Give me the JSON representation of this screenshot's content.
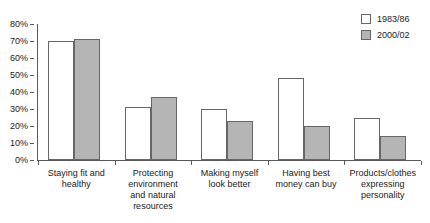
{
  "chart_data": {
    "type": "bar",
    "title": "",
    "xlabel": "",
    "ylabel": "",
    "ylim": [
      0,
      80
    ],
    "grid": false,
    "legend_position": "top-right",
    "ytick_labels": [
      "80%",
      "70%",
      "60%",
      "50%",
      "40%",
      "30%",
      "20%",
      "10%",
      "0%"
    ],
    "ytick_values": [
      80,
      70,
      60,
      50,
      40,
      30,
      20,
      10,
      0
    ],
    "categories": [
      "Staying fit and healthy",
      "Protecting environment and natural resources",
      "Making myself look better",
      "Having best money can buy",
      "Products/clothes expressing personality"
    ],
    "category_lines": [
      [
        "Staying fit and",
        "healthy"
      ],
      [
        "Protecting",
        "environment",
        "and natural",
        "resources"
      ],
      [
        "Making myself",
        "look better"
      ],
      [
        "Having best",
        "money can buy"
      ],
      [
        "Products/clothes",
        "expressing",
        "personality"
      ]
    ],
    "series": [
      {
        "name": "1983/86",
        "color": "#ffffff",
        "values": [
          70,
          31,
          30,
          48,
          25
        ]
      },
      {
        "name": "2000/02",
        "color": "#b5b5b5",
        "values": [
          71,
          37,
          23,
          20,
          14
        ]
      }
    ]
  },
  "legend": {
    "items": [
      {
        "label": "1983/86"
      },
      {
        "label": "2000/02"
      }
    ]
  },
  "colors": {
    "series_1983_86": "#ffffff",
    "series_2000_02": "#b5b5b5",
    "axis": "#5a5a5a",
    "bar_outline": "#666666",
    "text": "#1a1a1a",
    "background": "#ffffff"
  }
}
